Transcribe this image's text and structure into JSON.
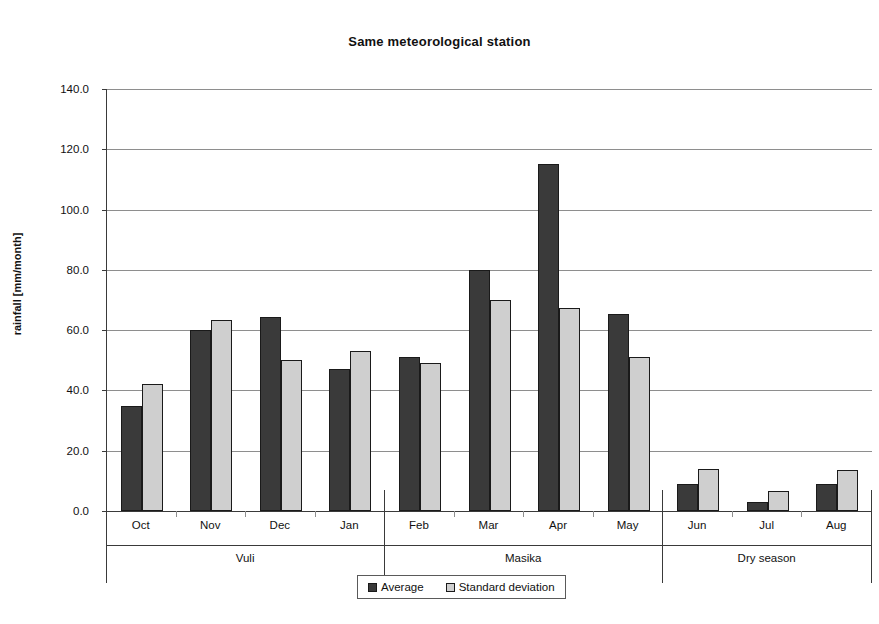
{
  "chart_data": {
    "type": "bar",
    "title": "Same meteorological station",
    "xlabel": "",
    "ylabel": "rainfall [mm/month]",
    "ylim": [
      0.0,
      140.0
    ],
    "ytick_step": 20.0,
    "ytick_labels": [
      "140.0",
      "120.0",
      "100.0",
      "80.0",
      "60.0",
      "40.0",
      "20.0",
      "0.0"
    ],
    "ytick_values": [
      140.0,
      120.0,
      100.0,
      80.0,
      60.0,
      40.0,
      20.0,
      0.0
    ],
    "grid": true,
    "legend_position": "bottom-center",
    "categories": [
      "Oct",
      "Nov",
      "Dec",
      "Jan",
      "Feb",
      "Mar",
      "Apr",
      "May",
      "Jun",
      "Jul",
      "Aug"
    ],
    "series": [
      {
        "name": "Average",
        "color": "#3a3a3a",
        "values": [
          35.0,
          60.0,
          64.5,
          47.0,
          51.0,
          80.0,
          115.0,
          65.5,
          9.0,
          3.0,
          9.0
        ]
      },
      {
        "name": "Standard deviation",
        "color": "#cfcfcf",
        "values": [
          42.0,
          63.5,
          50.0,
          53.0,
          49.0,
          70.0,
          67.5,
          51.0,
          14.0,
          6.7,
          13.7
        ]
      }
    ],
    "groups": [
      {
        "label": "Vuli",
        "categories": [
          "Oct",
          "Nov",
          "Dec",
          "Jan"
        ]
      },
      {
        "label": "Masika",
        "categories": [
          "Feb",
          "Mar",
          "Apr",
          "May"
        ]
      },
      {
        "label": "Dry season",
        "categories": [
          "Jun",
          "Jul",
          "Aug"
        ]
      }
    ]
  },
  "legend": {
    "items": [
      {
        "label": "Average",
        "swatch": "avg"
      },
      {
        "label": "Standard deviation",
        "swatch": "std"
      }
    ]
  }
}
